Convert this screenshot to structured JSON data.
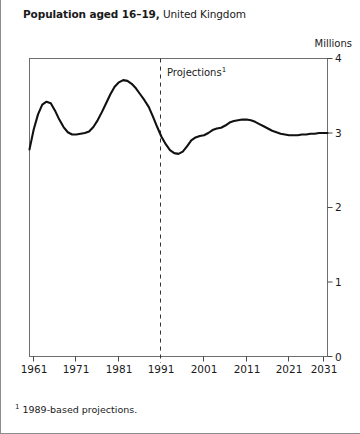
{
  "title": {
    "bold_part": "Population aged 16–19,",
    "regular_part": " United Kingdom"
  },
  "units_label": "Millions",
  "projections_annotation": {
    "text": "Projections",
    "marker": "1"
  },
  "footnote": {
    "marker": "1",
    "text": " 1989-based projections."
  },
  "colors": {
    "line": "#111111",
    "axis": "#555555",
    "frame": "#8c8c8c",
    "projection_divider": "#333333",
    "background": "#ffffff"
  },
  "chart_data": {
    "type": "line",
    "title": "Population aged 16–19, United Kingdom",
    "xlabel": "",
    "ylabel": "Millions",
    "ylim": [
      0,
      4
    ],
    "xlim": [
      1961,
      2031
    ],
    "grid": false,
    "legend": null,
    "yticks": [
      0,
      1,
      2,
      3,
      4
    ],
    "ytick_labels": [
      "0",
      "1",
      "2",
      "3",
      "4"
    ],
    "xticks": [
      1961,
      1971,
      1981,
      1991,
      2001,
      2011,
      2021,
      2031
    ],
    "xtick_labels": [
      "1961",
      "1971",
      "1981",
      "1991",
      "2001",
      "2011",
      "2021",
      "2031"
    ],
    "annotations": [
      {
        "type": "vline",
        "x": 1991,
        "style": "dashed",
        "label": "Projections¹"
      }
    ],
    "series": [
      {
        "name": "Population aged 16–19",
        "units": "millions",
        "x": [
          1961,
          1962,
          1963,
          1964,
          1965,
          1966,
          1967,
          1968,
          1969,
          1970,
          1971,
          1972,
          1973,
          1974,
          1975,
          1976,
          1977,
          1978,
          1979,
          1980,
          1981,
          1982,
          1983,
          1984,
          1985,
          1986,
          1987,
          1988,
          1989,
          1990,
          1991,
          1992,
          1993,
          1994,
          1995,
          1996,
          1997,
          1998,
          1999,
          2000,
          2001,
          2002,
          2003,
          2004,
          2005,
          2006,
          2007,
          2008,
          2009,
          2010,
          2011,
          2012,
          2013,
          2014,
          2015,
          2016,
          2017,
          2018,
          2019,
          2020,
          2021,
          2022,
          2023,
          2024,
          2025,
          2026,
          2027,
          2028,
          2029,
          2030,
          2031
        ],
        "y": [
          2.78,
          3.05,
          3.25,
          3.38,
          3.42,
          3.4,
          3.3,
          3.18,
          3.08,
          3.01,
          2.98,
          2.98,
          2.99,
          3.0,
          3.02,
          3.08,
          3.17,
          3.28,
          3.4,
          3.52,
          3.62,
          3.68,
          3.71,
          3.7,
          3.66,
          3.6,
          3.52,
          3.44,
          3.35,
          3.22,
          3.08,
          2.95,
          2.85,
          2.77,
          2.73,
          2.72,
          2.75,
          2.82,
          2.9,
          2.94,
          2.96,
          2.97,
          3.0,
          3.04,
          3.06,
          3.07,
          3.1,
          3.14,
          3.16,
          3.17,
          3.18,
          3.18,
          3.17,
          3.15,
          3.12,
          3.09,
          3.06,
          3.03,
          3.01,
          2.99,
          2.98,
          2.97,
          2.97,
          2.97,
          2.98,
          2.98,
          2.99,
          2.99,
          3.0,
          3.0,
          3.0
        ]
      }
    ],
    "projection_start_year": 1991
  }
}
